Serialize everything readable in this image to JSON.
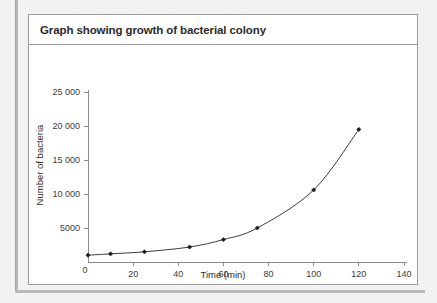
{
  "panel": {
    "title": "Graph showing growth of bacterial colony"
  },
  "chart_data": {
    "type": "line",
    "title": "Graph showing growth of bacterial colony",
    "xlabel": "Time (min)",
    "ylabel": "Number of bacteria",
    "xlim": [
      0,
      140
    ],
    "ylim": [
      0,
      25000
    ],
    "grid": false,
    "legend": "none",
    "marker": "diamond",
    "line_color": "#3c3c3c",
    "marker_color": "#1a1a1a",
    "xticks": [
      0,
      20,
      40,
      60,
      80,
      100,
      120,
      140
    ],
    "xtick_labels": [
      "0",
      "20",
      "40",
      "60",
      "80",
      "100",
      "120",
      "140"
    ],
    "yticks": [
      0,
      5000,
      10000,
      15000,
      20000,
      25000
    ],
    "ytick_labels": [
      "0",
      "5000",
      "10 000",
      "15 000",
      "20 000",
      "25 000"
    ],
    "x": [
      0,
      10,
      25,
      45,
      60,
      75,
      100,
      120
    ],
    "values": [
      1000,
      1200,
      1500,
      2200,
      3300,
      5000,
      10600,
      19500
    ],
    "series": [
      {
        "name": "Number of bacteria",
        "points": [
          {
            "x": 0,
            "y": 1000
          },
          {
            "x": 10,
            "y": 1200
          },
          {
            "x": 25,
            "y": 1500
          },
          {
            "x": 45,
            "y": 2200
          },
          {
            "x": 60,
            "y": 3300
          },
          {
            "x": 75,
            "y": 5000
          },
          {
            "x": 100,
            "y": 10600
          },
          {
            "x": 120,
            "y": 19500
          }
        ]
      }
    ]
  }
}
